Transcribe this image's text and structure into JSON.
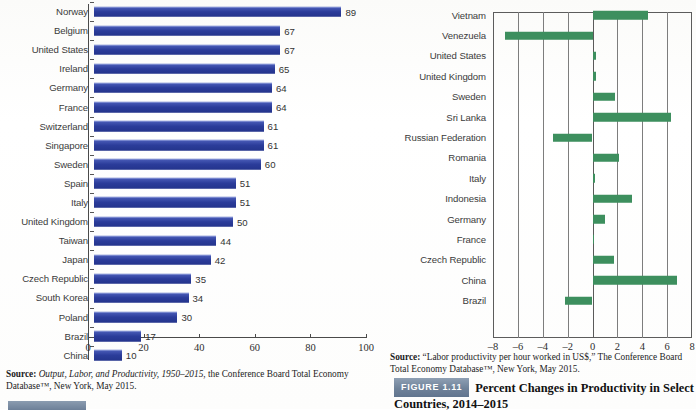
{
  "chart_data": [
    {
      "id": "left",
      "type": "bar",
      "orientation": "horizontal",
      "title": "",
      "xlabel": "",
      "ylabel": "",
      "xlim": [
        0,
        100
      ],
      "xticks": [
        0,
        20,
        40,
        60,
        80,
        100
      ],
      "grid": false,
      "bar_color": "#2b3c9a",
      "categories": [
        "Norway",
        "Belgium",
        "United States",
        "Ireland",
        "Germany",
        "France",
        "Switzerland",
        "Singapore",
        "Sweden",
        "Spain",
        "Italy",
        "United Kingdom",
        "Taiwan",
        "Japan",
        "Czech Republic",
        "South Korea",
        "Poland",
        "Brazil",
        "China"
      ],
      "values": [
        89,
        67,
        67,
        65,
        64,
        64,
        61,
        61,
        60,
        51,
        51,
        50,
        44,
        42,
        35,
        34,
        30,
        17,
        10
      ],
      "source_prefix": "Source:",
      "source_italic": "Output, Labor, and Productivity, 1950–2015",
      "source_rest": ", the Conference Board Total Economy Database™, New York, May 2015."
    },
    {
      "id": "right",
      "type": "bar",
      "orientation": "horizontal",
      "title": "Percent Changes in Productivity in Select Countries, 2014–2015",
      "xlabel": "",
      "ylabel": "",
      "xlim": [
        -8,
        8
      ],
      "xticks": [
        -8,
        -6,
        -4,
        -2,
        0,
        2,
        4,
        6,
        8
      ],
      "xtick_labels": [
        "–8",
        "–6",
        "–4",
        "–2",
        "0",
        "2",
        "4",
        "6",
        "8"
      ],
      "grid": true,
      "bar_color": "#3d8f5e",
      "categories": [
        "Vietnam",
        "Venezuela",
        "United States",
        "United Kingdom",
        "Sweden",
        "Sri Lanka",
        "Russian Federation",
        "Romania",
        "Italy",
        "Indonesia",
        "Germany",
        "France",
        "Czech Republic",
        "China",
        "Brazil"
      ],
      "values": [
        4.5,
        -7.0,
        0.3,
        0.3,
        1.8,
        6.3,
        -3.2,
        2.1,
        0.2,
        3.2,
        1.0,
        0.1,
        1.7,
        6.8,
        -2.2
      ],
      "source_prefix": "Source:",
      "source_rest": " “Labor productivity per hour worked in US$,” The Conference Board Total Economy Database™, New York, May 2015."
    }
  ],
  "left_panel": {
    "source_prefix": "Source:",
    "source_italic": "Output, Labor, and Productivity, 1950–2015",
    "source_rest": ", the Conference Board Total Economy Database™, New York, May 2015."
  },
  "right_panel": {
    "source_prefix": "Source:",
    "source_rest": " “Labor productivity per hour worked in US$,” The Conference Board Total Economy Database™, New York, May 2015.",
    "figure_badge": "FIGURE 1.11",
    "figure_title": "Percent Changes in Productivity in Select Countries, 2014–2015"
  }
}
